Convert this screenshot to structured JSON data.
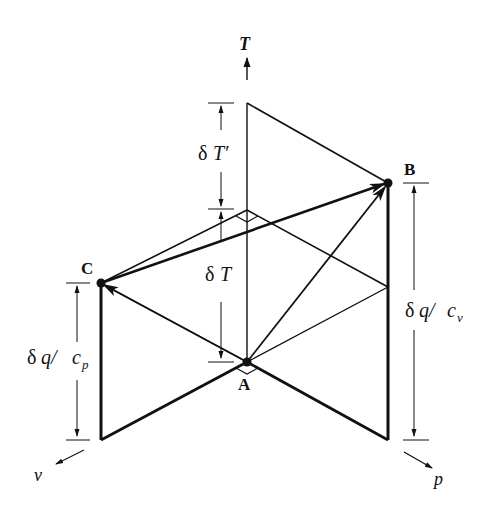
{
  "diagram": {
    "axes": {
      "T": "T",
      "v": "v",
      "p": "p"
    },
    "points": {
      "A": "A",
      "B": "B",
      "C": "C"
    },
    "dimensions": {
      "dT_prime_delta": "δ",
      "dT_prime_var": "T′",
      "dT_delta": "δ",
      "dT_var": "T",
      "dq_cv_delta": "δ",
      "dq_cv_q": "q/",
      "dq_cv_c": "c",
      "dq_cv_sub": "v",
      "dq_cp_delta": "δ",
      "dq_cp_q": "q/",
      "dq_cp_c": "c",
      "dq_cp_sub": "p"
    },
    "colors": {
      "line": "#111111",
      "background": "#ffffff"
    }
  }
}
